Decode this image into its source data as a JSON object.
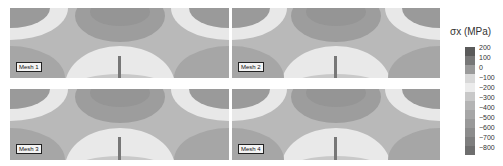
{
  "figure": {
    "panels": [
      {
        "label": "Mesh 1"
      },
      {
        "label": "Mesh 2"
      },
      {
        "label": "Mesh 3"
      },
      {
        "label": "Mesh 4"
      }
    ],
    "colorbar": {
      "title": "σx (MPa)",
      "ticks": [
        "200",
        "100",
        "0",
        "−100",
        "−200",
        "−300",
        "−400",
        "−500",
        "−600",
        "−700",
        "−800"
      ],
      "colors": [
        "#5a5a5a",
        "#777777",
        "#9a9a9a",
        "#d8d8d8",
        "#ececec",
        "#c8c8c8",
        "#b4b4b4",
        "#a6a6a6",
        "#999999",
        "#8c8c8c",
        "#7e7e7e",
        "#6e6e6e"
      ]
    }
  }
}
